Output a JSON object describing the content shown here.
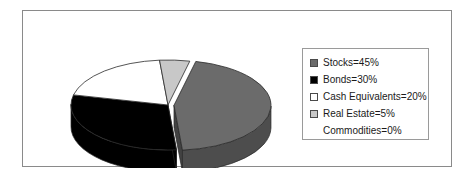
{
  "canvas": {
    "width": 467,
    "height": 183,
    "background": "#ffffff",
    "border_color": "#8a8a8a"
  },
  "legend": {
    "position": "right",
    "border_color": "#9a9a9a",
    "items": [
      {
        "label": "Stocks=45%",
        "name": "Stocks",
        "value": 45,
        "color": "#6b6b6b",
        "swatch": true
      },
      {
        "label": "Bonds=30%",
        "name": "Bonds",
        "value": 30,
        "color": "#000000",
        "swatch": true
      },
      {
        "label": "Cash Equivalents=20%",
        "name": "Cash Equivalents",
        "value": 20,
        "color": "#ffffff",
        "swatch": true
      },
      {
        "label": "Real Estate=5%",
        "name": "Real Estate",
        "value": 5,
        "color": "#c8c8c8",
        "swatch": true
      },
      {
        "label": "Commodities=0%",
        "name": "Commodities",
        "value": 0,
        "color": "#ffffff",
        "swatch": false
      }
    ]
  },
  "chart_data": {
    "type": "pie",
    "title": "",
    "xlabel": "",
    "ylabel": "",
    "style": "3d-exploded",
    "labels": [
      "Stocks",
      "Bonds",
      "Cash Equivalents",
      "Real Estate",
      "Commodities"
    ],
    "values": [
      45,
      30,
      20,
      5,
      0
    ],
    "display_labels": [
      "Stocks=45%",
      "Bonds=30%",
      "Cash Equivalents=20%",
      "Real Estate=5%",
      "Commodities=0%"
    ],
    "colors": [
      "#6b6b6b",
      "#000000",
      "#ffffff",
      "#c8c8c8",
      "#ffffff"
    ],
    "units": "percent",
    "total": 100,
    "legend_position": "right",
    "grid": false,
    "exploded_slices": [
      "Stocks"
    ],
    "geometry": {
      "center_x": 145,
      "center_y": 94,
      "radius_x": 97,
      "radius_y": 45,
      "depth": 22,
      "start_angle_deg": -77,
      "explode_offset": 6
    }
  }
}
